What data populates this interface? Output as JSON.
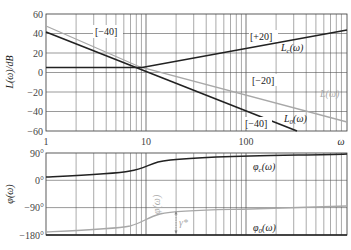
{
  "chart_data": [
    {
      "type": "line",
      "title": "",
      "xlabel": "ω",
      "ylabel": "L(ω)/dB",
      "xscale": "log",
      "xlim": [
        1,
        1000
      ],
      "ylim": [
        -60,
        60
      ],
      "grid": true,
      "x_tick_labels": [
        "1",
        "10",
        "100"
      ],
      "y_ticks": [
        60,
        40,
        20,
        0,
        -20,
        -40,
        -60
      ],
      "series": [
        {
          "name": "L0(ω)",
          "label": "L₀(ω)",
          "color": "#222222",
          "x": [
            1,
            190
          ],
          "y": [
            42,
            -60
          ],
          "slope_note": "[-40]"
        },
        {
          "name": "L(ω)",
          "label": "L(ω)",
          "color": "#999999",
          "x": [
            1,
            9,
            1000
          ],
          "y": [
            48,
            5,
            -36
          ],
          "slope_notes": [
            "[-40]",
            "[-20]"
          ]
        },
        {
          "name": "Lc(ω)",
          "label": "Lc(ω)",
          "color": "#222222",
          "x": [
            1,
            9,
            1000
          ],
          "y": [
            5,
            5,
            48
          ],
          "slope_note": "[+20]"
        }
      ],
      "annotations": [
        "[-40]",
        "[+20]",
        "[-20]",
        "[-40]"
      ]
    },
    {
      "type": "line",
      "title": "",
      "xlabel": "ω",
      "ylabel": "φ(ω)",
      "xscale": "log",
      "xlim": [
        1,
        1000
      ],
      "ylim": [
        -180,
        90
      ],
      "grid": true,
      "y_tick_labels": [
        "90°",
        "0°",
        "-90°",
        "-180°"
      ],
      "series": [
        {
          "name": "φc(ω)",
          "label": "φc(ω)",
          "color": "#222222",
          "x": [
            1,
            3,
            6,
            8,
            10,
            15,
            30,
            100,
            1000
          ],
          "y": [
            3,
            8,
            14,
            20,
            32,
            50,
            65,
            75,
            84
          ]
        },
        {
          "name": "φ(ω)",
          "label": "φ(ω)",
          "color": "#999999",
          "x": [
            1,
            3,
            6,
            8,
            10,
            15,
            30,
            100,
            1000
          ],
          "y": [
            -174,
            -170,
            -164,
            -158,
            -146,
            -128,
            -112,
            -104,
            -88
          ]
        },
        {
          "name": "φ0(ω)",
          "label": "φ0(ω)",
          "color": "#222222",
          "x": [
            1,
            1000
          ],
          "y": [
            -180,
            -180
          ]
        }
      ],
      "annotations": [
        "γ*"
      ]
    }
  ],
  "labels": {
    "mag_ylabel": "L(ω)/dB",
    "phase_ylabel": "φ(ω)",
    "x_axis_symbol": "ω",
    "x_ticks": [
      "1",
      "10",
      "100"
    ],
    "mag_yticks": [
      "60",
      "40",
      "20",
      "0",
      "−20",
      "−40",
      "−60"
    ],
    "phase_yticks": [
      "90°",
      "0°",
      "−90°",
      "−180°"
    ],
    "slope_m40_a": "[−40]",
    "slope_p20": "[+20]",
    "slope_m20": "[−20]",
    "slope_m40_b": "[−40]",
    "Lc": "L",
    "Lc_sub": "c",
    "Lc_arg": "(ω)",
    "L": "L(ω)",
    "L0": "L",
    "L0_sub": "0",
    "L0_arg": "(ω)",
    "phic": "φ",
    "phic_sub": "c",
    "phic_arg": "(ω)",
    "phi": "φ(ω)",
    "phi0": "φ",
    "phi0_sub": "0",
    "phi0_arg": "(ω)",
    "gamma": "γ*"
  }
}
